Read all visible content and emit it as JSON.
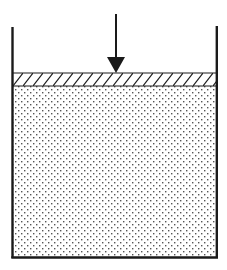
{
  "diagram": {
    "type": "piston-compression-container",
    "elements": {
      "container": {
        "label": "",
        "left_x": 12,
        "right_x": 217,
        "top_y": 27,
        "bottom_y": 258,
        "wall_color": "#222222"
      },
      "piston_layer": {
        "label": "",
        "fill": "hatched",
        "top_y": 73,
        "bottom_y": 86
      },
      "medium": {
        "label": "",
        "fill": "stippled",
        "top_y": 86,
        "bottom_y": 258
      },
      "load_arrow": {
        "label": "",
        "direction": "down",
        "x": 116,
        "from_y": 14,
        "to_y": 73
      }
    },
    "colors": {
      "ink": "#1a1a1a",
      "background": "#ffffff",
      "dots": "#555555"
    }
  }
}
